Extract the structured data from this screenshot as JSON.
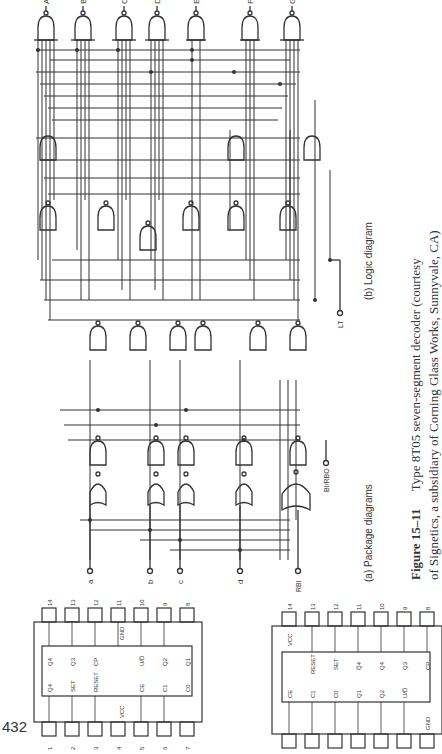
{
  "page": {
    "page_number": "432",
    "orientation": "rotated-90-ccw"
  },
  "figure": {
    "label": "Figure 15–11",
    "caption_line1": "Type 8T05 seven-segment decoder (courtesy",
    "caption_line2": "of Signetics, a subsidiary of Corning Glass Works, Sunnyvale, CA)",
    "subfigure_a": "(a) Package diagrams",
    "subfigure_b": "(b) Logic diagram"
  },
  "logic_diagram": {
    "outputs": [
      "A",
      "B",
      "C",
      "D",
      "E",
      "F",
      "G"
    ],
    "inputs": [
      "a",
      "b",
      "c",
      "d"
    ],
    "control_inputs": {
      "rbi": "RBI",
      "bi_rbo": "BI/RBO",
      "lt": "LT"
    }
  },
  "package_left": {
    "top_pins": [
      "14",
      "13",
      "12",
      "11",
      "10",
      "9",
      "8"
    ],
    "bottom_pins": [
      "1",
      "2",
      "3",
      "4",
      "5",
      "6",
      "7"
    ],
    "outer_labels_top": [
      "",
      "",
      "",
      "GND",
      "",
      "",
      ""
    ],
    "outer_labels_bottom": [
      "",
      "",
      "",
      "VCC",
      "",
      "",
      ""
    ],
    "inner_top": [
      "Q4",
      "Q3",
      "CP",
      "",
      "U/D̅",
      "Q2",
      "Q1"
    ],
    "inner_bottom": [
      "Q4",
      "SET",
      "RESET",
      "",
      "CE",
      "C1",
      "C0"
    ]
  },
  "package_right": {
    "top_pins": [
      "14",
      "13",
      "12",
      "11",
      "10",
      "9",
      "8"
    ],
    "outer_labels_top": [
      "VCC",
      "",
      "",
      "",
      "",
      "",
      ""
    ],
    "outer_labels_bottom": [
      "",
      "",
      "",
      "",
      "",
      "",
      "GND"
    ],
    "inner_top": [
      "",
      "RESET",
      "SET",
      "Q̅4",
      "Q4",
      "Q3",
      "CP"
    ],
    "inner_bottom": [
      "CE",
      "C1",
      "C0",
      "Q1",
      "Q2",
      "U/D̅",
      ""
    ]
  }
}
